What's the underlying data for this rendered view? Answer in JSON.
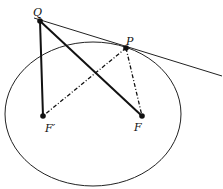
{
  "diagram": {
    "type": "ellipse-tangent-foci",
    "labels": {
      "Q": "Q",
      "P": "P",
      "F_prime": "F′",
      "F": "F"
    },
    "points": {
      "Q": [
        40,
        21
      ],
      "P": [
        126,
        48
      ],
      "F_prime": [
        43,
        116
      ],
      "F": [
        142,
        116
      ]
    },
    "ellipse": {
      "cx": 93,
      "cy": 114,
      "rx": 88,
      "ry": 72
    },
    "tangent_line": {
      "from": [
        34,
        18
      ],
      "to": [
        222,
        76
      ]
    },
    "solid_segments": [
      [
        "Q",
        "F_prime"
      ],
      [
        "Q",
        "F"
      ]
    ],
    "dashdot_segments": [
      [
        "P",
        "F_prime"
      ],
      [
        "P",
        "F"
      ]
    ],
    "colors": {
      "stroke": "#111111",
      "background": "#ffffff"
    }
  }
}
